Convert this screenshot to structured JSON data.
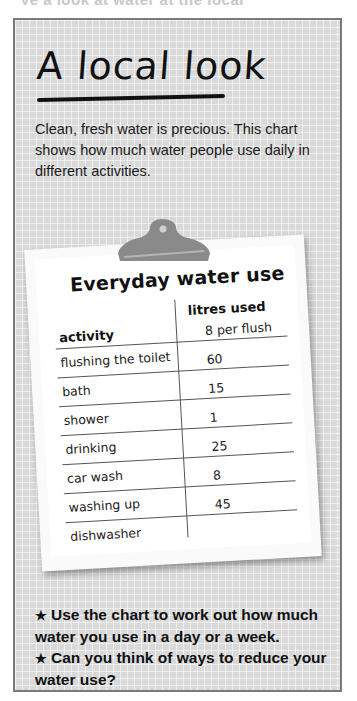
{
  "header_partial_text": "Ve a look at water at the local",
  "panel": {
    "title": "A local look",
    "intro": "Clean, fresh water is precious. This chart shows how much water people use daily in different activities."
  },
  "clipboard": {
    "title": "Everyday water use",
    "columns": [
      "activity",
      "litres used"
    ],
    "rows": [
      {
        "activity": "flushing the toilet",
        "litres": "8 per flush"
      },
      {
        "activity": "bath",
        "litres": "60"
      },
      {
        "activity": "shower",
        "litres": "15"
      },
      {
        "activity": "drinking",
        "litres": "1"
      },
      {
        "activity": "car wash",
        "litres": "25"
      },
      {
        "activity": "washing up",
        "litres": "8"
      },
      {
        "activity": "dishwasher",
        "litres": "45"
      }
    ]
  },
  "questions": {
    "bullet_icon": "★",
    "items": [
      "Use the chart to work out how much water you use in a day or a week.",
      "Can you think of ways to reduce your water use?"
    ]
  },
  "colors": {
    "panel_bg": "#d9d9d9",
    "panel_border": "#7a7a7a",
    "clip": "#8a8a8a",
    "paper": "#ffffff"
  }
}
